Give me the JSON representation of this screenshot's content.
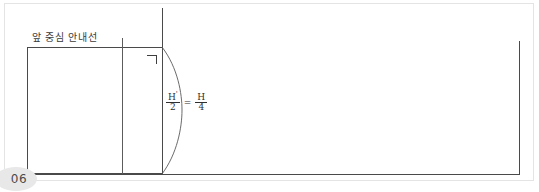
{
  "page": {
    "number": "06",
    "background_color": "#ffffff",
    "frame_color": "#e4e4e4",
    "line_color": "#4a4a4a"
  },
  "diagram": {
    "title_label": "앞 중심 안내선",
    "corner_mark_glyph": "ㄱ",
    "formula": {
      "left": {
        "numerator": "H",
        "numerator_prime": "'",
        "denominator": "2"
      },
      "operator": "=",
      "right": {
        "numerator": "H",
        "denominator": "4"
      },
      "plain_text": "H'/2 = H/4"
    },
    "elements": [
      {
        "name": "center-vertical-line",
        "kind": "line",
        "orientation": "vertical"
      },
      {
        "name": "guide-tick-line",
        "kind": "line",
        "orientation": "vertical"
      },
      {
        "name": "body-rectangle",
        "kind": "rect"
      },
      {
        "name": "baseline",
        "kind": "line",
        "orientation": "horizontal"
      },
      {
        "name": "right-vertical-line",
        "kind": "line",
        "orientation": "vertical"
      },
      {
        "name": "measurement-arc",
        "kind": "arc"
      }
    ]
  }
}
